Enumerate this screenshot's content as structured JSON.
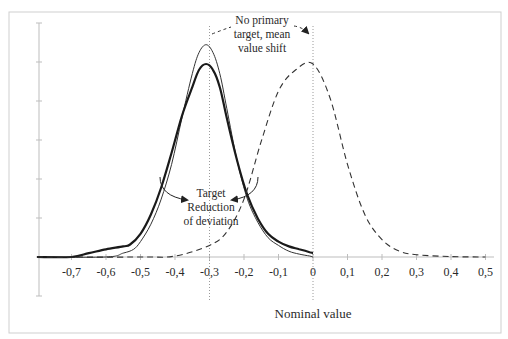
{
  "chart_data": {
    "type": "line",
    "title": "",
    "xlabel": "Nominal value",
    "ylabel": "",
    "xlim": [
      -0.8,
      0.5
    ],
    "ylim": [
      -0.3,
      1.2
    ],
    "grid": false,
    "legend": null,
    "x_ticks": [
      -0.7,
      -0.6,
      -0.5,
      -0.4,
      -0.3,
      -0.2,
      -0.1,
      0,
      0.1,
      0.2,
      0.3,
      0.4,
      0.5
    ],
    "x_tick_labels": [
      "-0,7",
      "-0,6",
      "-0,5",
      "-0,4",
      "-0,3",
      "-0,2",
      "-0,1",
      "0",
      "0,1",
      "0,2",
      "0,3",
      "0,4",
      "0,5"
    ],
    "y_tick_count": 8,
    "series": [
      {
        "name": "Target reduction of deviation (narrow)",
        "style": "thin-solid",
        "x": [
          -0.8,
          -0.6,
          -0.55,
          -0.52,
          -0.5,
          -0.47,
          -0.44,
          -0.41,
          -0.38,
          -0.35,
          -0.33,
          -0.31,
          -0.29,
          -0.27,
          -0.25,
          -0.22,
          -0.19,
          -0.16,
          -0.13,
          -0.1,
          -0.07,
          -0.04,
          -0.01,
          0
        ],
        "y": [
          0,
          0,
          0.02,
          0.04,
          0.08,
          0.17,
          0.3,
          0.48,
          0.72,
          0.95,
          1.06,
          1.1,
          1.06,
          0.95,
          0.77,
          0.5,
          0.3,
          0.18,
          0.1,
          0.06,
          0.03,
          0.015,
          0.005,
          0
        ]
      },
      {
        "name": "Target (wider)",
        "style": "thick-solid",
        "x": [
          -0.8,
          -0.7,
          -0.65,
          -0.6,
          -0.55,
          -0.53,
          -0.5,
          -0.47,
          -0.44,
          -0.41,
          -0.38,
          -0.35,
          -0.33,
          -0.31,
          -0.29,
          -0.27,
          -0.25,
          -0.22,
          -0.19,
          -0.16,
          -0.13,
          -0.1,
          -0.07,
          -0.04,
          -0.01,
          0
        ],
        "y": [
          0,
          0,
          0.02,
          0.04,
          0.055,
          0.065,
          0.12,
          0.22,
          0.36,
          0.54,
          0.73,
          0.88,
          0.97,
          1.0,
          0.97,
          0.88,
          0.72,
          0.5,
          0.32,
          0.2,
          0.12,
          0.08,
          0.055,
          0.04,
          0.025,
          0.02
        ]
      },
      {
        "name": "No primary target, mean value shift",
        "style": "dashed",
        "x": [
          -0.8,
          -0.5,
          -0.4,
          -0.3,
          -0.25,
          -0.2,
          -0.15,
          -0.1,
          -0.05,
          0,
          0.05,
          0.1,
          0.15,
          0.2,
          0.25,
          0.3,
          0.4,
          0.5
        ],
        "y": [
          0,
          0,
          0.005,
          0.06,
          0.13,
          0.3,
          0.6,
          0.86,
          0.97,
          1.0,
          0.82,
          0.48,
          0.22,
          0.09,
          0.03,
          0.012,
          0.002,
          0
        ]
      }
    ],
    "reference_lines": [
      {
        "x": -0.3,
        "label": ""
      },
      {
        "x": 0,
        "label": "Nominal value"
      }
    ],
    "annotations": [
      {
        "lines": [
          "No primary",
          "target, mean",
          "value shift"
        ],
        "anchor_x": -0.15,
        "points_to": [
          0,
          1.15
        ]
      },
      {
        "lines": [
          "Target",
          "Reduction",
          "of deviation"
        ],
        "anchor_x": -0.3
      }
    ]
  },
  "labels": {
    "xlabel": "Nominal value",
    "annot_top": [
      "No primary",
      "target, mean",
      "value shift"
    ],
    "annot_mid": [
      "Target",
      "Reduction",
      "of deviation"
    ]
  }
}
